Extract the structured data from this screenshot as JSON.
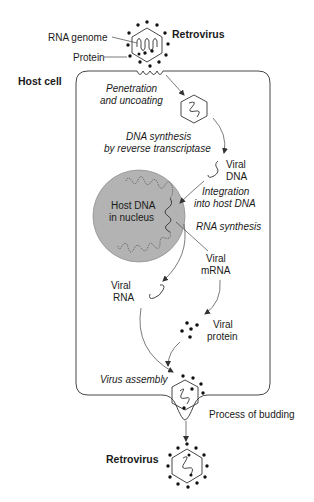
{
  "header": {
    "partial_text": ""
  },
  "labels": {
    "rna_genome": "RNA genome",
    "protein": "Protein",
    "retrovirus_top": "Retrovirus",
    "host_cell": "Host cell",
    "penetration_1": "Penetration",
    "penetration_2": "and uncoating",
    "dna_synth_1": "DNA synthesis",
    "dna_synth_2": "by reverse transcriptase",
    "viral_dna_1": "Viral",
    "viral_dna_2": "DNA",
    "integration_1": "Integration",
    "integration_2": "into host DNA",
    "host_dna_1": "Host DNA",
    "host_dna_2": "in nucleus",
    "rna_synthesis": "RNA synthesis",
    "viral_mrna_1": "Viral",
    "viral_mrna_2": "mRNA",
    "viral_rna_1": "Viral",
    "viral_rna_2": "RNA",
    "viral_protein_1": "Viral",
    "viral_protein_2": "protein",
    "virus_assembly": "Virus assembly",
    "budding": "Process of budding",
    "retrovirus_bottom": "Retrovirus"
  },
  "colors": {
    "nucleus_fill": "#b3b3b3",
    "line": "#333333",
    "text": "#1a1a1a"
  }
}
